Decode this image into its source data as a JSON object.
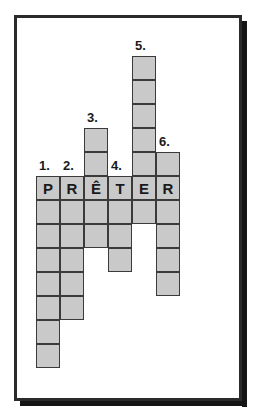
{
  "puzzle": {
    "type": "crossword-grid",
    "answer_word": "PRÊTER",
    "grid": {
      "cell_size": 24,
      "origin_x": 36,
      "letter_row_y": 176,
      "columns": 6,
      "cell_fill_color": "#c9c9c9",
      "cell_border_color": "#3a3a3a",
      "frame_color": "#2b2b2b",
      "background_color": "#ffffff"
    },
    "columns": [
      {
        "number": "1.",
        "letter": "P",
        "cells_above": 0,
        "cells_below": 7,
        "total_cells": 8,
        "number_label_position": "above-letter-row"
      },
      {
        "number": "2.",
        "letter": "R",
        "cells_above": 0,
        "cells_below": 5,
        "total_cells": 6,
        "number_label_position": "above-letter-row"
      },
      {
        "number": "3.",
        "letter": "Ê",
        "cells_above": 2,
        "cells_below": 2,
        "total_cells": 5,
        "number_label_position": "above-column-top"
      },
      {
        "number": "4.",
        "letter": "T",
        "cells_above": 0,
        "cells_below": 3,
        "total_cells": 4,
        "number_label_position": "above-letter-row"
      },
      {
        "number": "5.",
        "letter": "E",
        "cells_above": 5,
        "cells_below": 1,
        "total_cells": 7,
        "number_label_position": "above-column-top"
      },
      {
        "number": "6.",
        "letter": "R",
        "cells_above": 1,
        "cells_below": 4,
        "total_cells": 6,
        "number_label_position": "above-column-top"
      }
    ]
  }
}
